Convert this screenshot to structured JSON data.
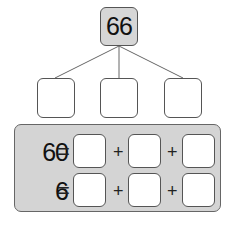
{
  "diagram": {
    "root": {
      "value": "66"
    },
    "children": [
      {
        "value": ""
      },
      {
        "value": ""
      },
      {
        "value": ""
      }
    ],
    "equations": [
      {
        "lhs": "60",
        "equals": "=",
        "operator": "+",
        "boxes": [
          "",
          "",
          ""
        ]
      },
      {
        "lhs": "6",
        "equals": "=",
        "operator": "+",
        "boxes": [
          "",
          "",
          ""
        ]
      }
    ]
  },
  "colors": {
    "root_fill": "#d6d6d6",
    "panel_fill": "#d4d4d4",
    "border": "#555555"
  }
}
